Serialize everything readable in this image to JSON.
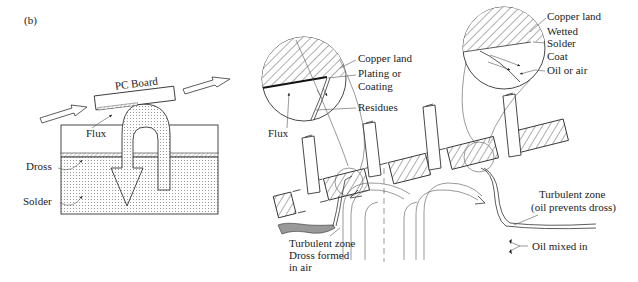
{
  "figure": {
    "panel_label": "(b)",
    "left_diagram": {
      "labels": {
        "pc_board": "PC Board",
        "flux": "Flux",
        "dross": "Dross",
        "solder": "Solder"
      }
    },
    "right_diagram": {
      "left_inset_labels": {
        "copper_land": "Copper land",
        "plating_line1": "Plating or",
        "plating_line2": "Coating",
        "residues": "Residues",
        "flux": "Flux"
      },
      "right_inset_labels": {
        "copper_land": "Copper land",
        "wetted": "Wetted",
        "solder": "Solder",
        "coat": "Coat",
        "oil_or_air": "Oil or air"
      },
      "bottom_left_labels": {
        "line1": "Turbulent zone",
        "line2": "Dross formed",
        "line3": "in air"
      },
      "bottom_right_labels": {
        "line1": "Turbulent zone",
        "line2": "(oil prevents dross)",
        "oil_mixed_in": "Oil mixed in"
      }
    }
  }
}
